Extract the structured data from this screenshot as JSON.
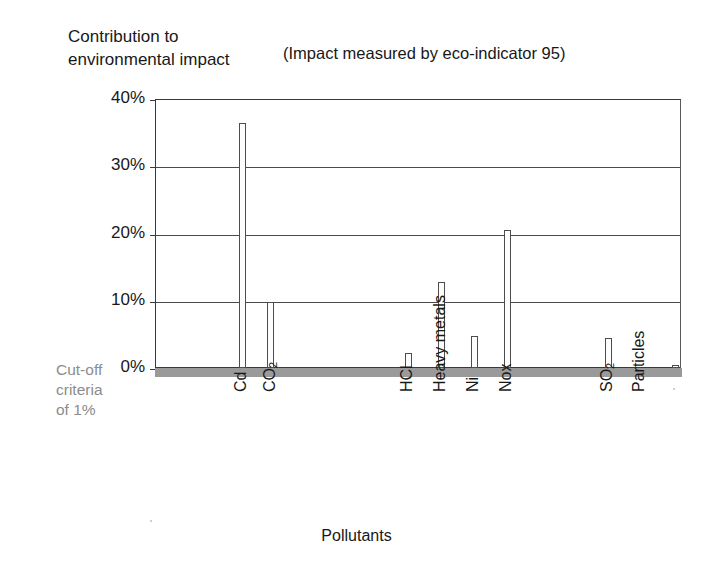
{
  "header": {
    "title": "Contribution to\nenvironmental impact",
    "subtitle": "(Impact measured by eco-indicator 95)"
  },
  "annotation": {
    "cutoff_label": "Cut-off\ncriteria\nof 1%",
    "cutoff_value_pct": 1,
    "cutoff_color": "#9a9a9a"
  },
  "axis": {
    "y_ticks": [
      "0%",
      "10%",
      "20%",
      "30%",
      "40%"
    ],
    "x_title": "Pollutants"
  },
  "chart_data": {
    "type": "bar",
    "title": "Contribution to environmental impact",
    "subtitle": "(Impact measured by eco-indicator 95)",
    "xlabel": "Pollutants",
    "ylabel": "Contribution to environmental impact",
    "ylim": [
      0,
      40
    ],
    "ytick_values": [
      0,
      10,
      20,
      30,
      40
    ],
    "ytick_labels": [
      "0%",
      "10%",
      "20%",
      "30%",
      "40%"
    ],
    "yunit": "%",
    "grid": "horizontal",
    "legend": "none",
    "bar_style": {
      "fill": "#fdfdfd",
      "edge": "#4d4d4d",
      "width_px": 7
    },
    "annotations": [
      {
        "text": "Cut-off criteria of 1%",
        "type": "threshold-band",
        "value": 1,
        "color": "#9a9a9a"
      }
    ],
    "categories": [
      "Cd",
      "CO2",
      "HCl",
      "Heavy metals",
      "Ni",
      "Nox",
      "SO2",
      "Particles"
    ],
    "category_labels": [
      "Cd",
      "CO₂",
      "HCl",
      "Heavy metals",
      "Ni",
      "Nox",
      "SO₂",
      "Particles"
    ],
    "values": [
      36.5,
      9.8,
      2.3,
      12.8,
      4.8,
      20.5,
      4.5,
      0.4
    ]
  },
  "bars": [
    {
      "name": "Cd",
      "label_html": "Cd",
      "value": 36.5,
      "x": 238,
      "label_x": 232,
      "label_y": 392
    },
    {
      "name": "CO2",
      "label_html": "CO<sub>2</sub>",
      "value": 9.8,
      "x": 266,
      "label_x": 261,
      "label_y": 392
    },
    {
      "name": "HCl",
      "label_html": "HCl",
      "value": 2.3,
      "x": 404,
      "label_x": 398,
      "label_y": 392
    },
    {
      "name": "Heavy metals",
      "label_html": "Heavy metals",
      "value": 12.8,
      "x": 437,
      "label_x": 431,
      "label_y": 392
    },
    {
      "name": "Ni",
      "label_html": "Ni",
      "value": 4.8,
      "x": 470,
      "label_x": 464,
      "label_y": 392
    },
    {
      "name": "Nox",
      "label_html": "Nox",
      "value": 20.5,
      "x": 503,
      "label_x": 497,
      "label_y": 392
    },
    {
      "name": "SO2",
      "label_html": "SO<sub>2</sub>",
      "value": 4.5,
      "x": 604,
      "label_x": 598,
      "label_y": 392
    },
    {
      "name": "Particles",
      "label_html": "Particles",
      "value": 0.4,
      "x": 671,
      "label_x": 630,
      "label_y": 392
    }
  ]
}
